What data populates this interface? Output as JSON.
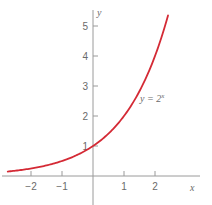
{
  "chart_data": {
    "type": "line",
    "title": "",
    "xlabel": "x",
    "ylabel": "y",
    "xlim": [
      -2.75,
      2.42
    ],
    "ylim": [
      0,
      5.3
    ],
    "x_ticks": [
      -2,
      -1,
      1,
      2
    ],
    "x_tick_labels": [
      "−2",
      "−1",
      "1",
      "2"
    ],
    "y_ticks": [
      1,
      2,
      3,
      4,
      5
    ],
    "y_tick_labels": [
      "1",
      "2",
      "3",
      "4",
      "5"
    ],
    "grid": false,
    "legend": null,
    "series": [
      {
        "name": "y = 2^x",
        "function": "2^x",
        "color": "#d42a35",
        "x": [
          -2.75,
          -2,
          -1.5,
          -1,
          -0.5,
          0,
          0.5,
          1,
          1.5,
          2,
          2.42
        ],
        "y": [
          0.149,
          0.25,
          0.354,
          0.5,
          0.707,
          1,
          1.414,
          2,
          2.828,
          4,
          5.35
        ]
      }
    ],
    "annotations": [
      {
        "text_base": "y = 2",
        "text_sup": "x",
        "x": 1.45,
        "y": 2.7
      }
    ]
  },
  "style": {
    "axis_color": "#9a9a9a",
    "text_color": "#6a6a6a",
    "curve_color": "#d42a35"
  }
}
